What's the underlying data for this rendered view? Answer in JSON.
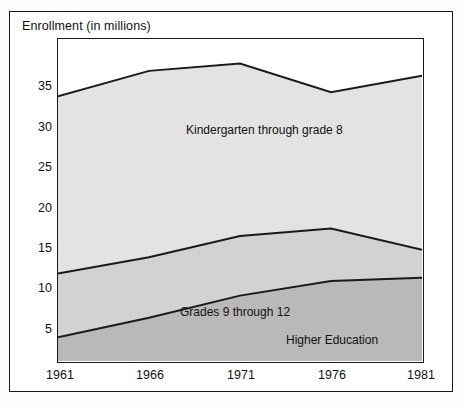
{
  "chart_data": {
    "type": "area",
    "title": "Enrollment (in millions)",
    "xlabel": "",
    "ylabel": "Enrollment (in millions)",
    "x": [
      1961,
      1966,
      1971,
      1976,
      1981
    ],
    "categories": [
      "1961",
      "1966",
      "1971",
      "1976",
      "1981"
    ],
    "xlim": [
      1961,
      1981
    ],
    "ylim": [
      0.6,
      40
    ],
    "yticks": [
      5,
      10,
      15,
      20,
      25,
      30,
      35
    ],
    "ytick_labels": [
      "5",
      "10",
      "15",
      "20",
      "25",
      "30",
      "35"
    ],
    "xticks": [
      1961,
      1966,
      1971,
      1976,
      1981
    ],
    "xtick_labels": [
      "1961",
      "1966",
      "1971",
      "1976",
      "1981"
    ],
    "grid": false,
    "legend_position": "inline-annotations",
    "stacked": true,
    "series": [
      {
        "name": "Kindergarten through grade 8",
        "values": [
          33.0,
          36.1,
          37.0,
          33.5,
          35.5
        ],
        "fill_color": "#e3e3e3",
        "line_color": "#1a1a1a"
      },
      {
        "name": "Grades 9 through 12",
        "values": [
          11.3,
          13.3,
          15.9,
          16.8,
          14.2
        ],
        "fill_color": "#d2d2d2",
        "line_color": "#1a1a1a"
      },
      {
        "name": "Higher Education",
        "values": [
          3.5,
          5.9,
          8.6,
          10.4,
          10.8
        ],
        "fill_color": "#b9b9b9",
        "line_color": "#1a1a1a"
      }
    ],
    "annotations": [
      {
        "text": "Kindergarten through grade 8",
        "series": "Kindergarten through grade 8"
      },
      {
        "text": "Grades 9 through 12",
        "series": "Grades 9 through 12"
      },
      {
        "text": "Higher Education",
        "series": "Higher Education"
      }
    ],
    "colors": {
      "frame": "#1a1a1a",
      "axis": "#1a1a1a",
      "background": "#ffffff",
      "band_k8": "#e3e3e3",
      "band_g912": "#d2d2d2",
      "band_higher": "#b9b9b9"
    }
  }
}
